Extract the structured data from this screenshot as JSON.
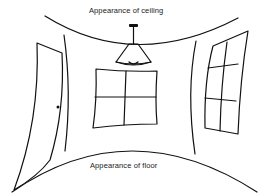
{
  "diagram": {
    "labels": {
      "ceiling": "Appearance of ceiling",
      "floor": "Appearance of floor"
    },
    "elements": [
      "ceiling-curve",
      "floor-curve",
      "left-wall-edge",
      "right-wall-edge",
      "pendant-lamp",
      "door-stippled",
      "door-knob",
      "center-window-4-pane",
      "right-window-6-pane"
    ],
    "colors": {
      "line": "#111111",
      "background": "#ffffff",
      "stipple": "#555555"
    }
  }
}
